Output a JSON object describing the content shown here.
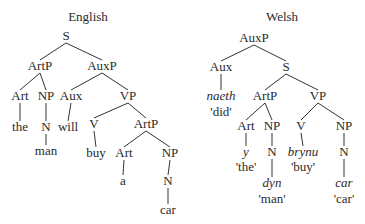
{
  "trees": [
    {
      "id": "english",
      "title": {
        "text": "English",
        "x": 88,
        "y": 21
      },
      "nodes": [
        {
          "id": "S",
          "label": "S",
          "x": 66,
          "y": 40
        },
        {
          "id": "ArtP1",
          "label": "ArtP",
          "x": 40,
          "y": 70
        },
        {
          "id": "AuxP",
          "label": "AuxP",
          "x": 102,
          "y": 70
        },
        {
          "id": "Art1",
          "label": "Art",
          "x": 20,
          "y": 100
        },
        {
          "id": "NP1",
          "label": "NP",
          "x": 46,
          "y": 100
        },
        {
          "id": "Aux",
          "label": "Aux",
          "x": 71,
          "y": 100
        },
        {
          "id": "VP",
          "label": "VP",
          "x": 128,
          "y": 100
        },
        {
          "id": "the",
          "label": "the",
          "x": 20,
          "y": 131
        },
        {
          "id": "N1",
          "label": "N",
          "x": 46,
          "y": 131
        },
        {
          "id": "will",
          "label": "will",
          "x": 68,
          "y": 131
        },
        {
          "id": "V",
          "label": "V",
          "x": 94,
          "y": 128
        },
        {
          "id": "ArtP2",
          "label": "ArtP",
          "x": 146,
          "y": 128
        },
        {
          "id": "man",
          "label": "man",
          "x": 46,
          "y": 155
        },
        {
          "id": "buy",
          "label": "buy",
          "x": 96,
          "y": 157
        },
        {
          "id": "Art2",
          "label": "Art",
          "x": 124,
          "y": 157
        },
        {
          "id": "NP2",
          "label": "NP",
          "x": 170,
          "y": 157
        },
        {
          "id": "a",
          "label": "a",
          "x": 123,
          "y": 185
        },
        {
          "id": "N2",
          "label": "N",
          "x": 168,
          "y": 185
        },
        {
          "id": "car",
          "label": "car",
          "x": 168,
          "y": 214
        }
      ],
      "edges": [
        [
          "S",
          "ArtP1"
        ],
        [
          "S",
          "AuxP"
        ],
        [
          "ArtP1",
          "Art1"
        ],
        [
          "ArtP1",
          "NP1"
        ],
        [
          "AuxP",
          "Aux"
        ],
        [
          "AuxP",
          "VP"
        ],
        [
          "Art1",
          "the"
        ],
        [
          "NP1",
          "N1"
        ],
        [
          "Aux",
          "will"
        ],
        [
          "VP",
          "V"
        ],
        [
          "VP",
          "ArtP2"
        ],
        [
          "N1",
          "man"
        ],
        [
          "V",
          "buy"
        ],
        [
          "ArtP2",
          "Art2"
        ],
        [
          "ArtP2",
          "NP2"
        ],
        [
          "Art2",
          "a"
        ],
        [
          "NP2",
          "N2"
        ],
        [
          "N2",
          "car"
        ]
      ]
    },
    {
      "id": "welsh",
      "title": {
        "text": "Welsh",
        "x": 282,
        "y": 21
      },
      "nodes": [
        {
          "id": "AuxP",
          "label": "AuxP",
          "x": 254,
          "y": 42
        },
        {
          "id": "Aux",
          "label": "Aux",
          "x": 221,
          "y": 71
        },
        {
          "id": "S",
          "label": "S",
          "x": 286,
          "y": 71
        },
        {
          "id": "naeth",
          "label": "naeth",
          "x": 221,
          "y": 100,
          "italic": true
        },
        {
          "id": "did",
          "label": "'did'",
          "x": 221,
          "y": 116
        },
        {
          "id": "ArtP",
          "label": "ArtP",
          "x": 265,
          "y": 100
        },
        {
          "id": "VP",
          "label": "VP",
          "x": 318,
          "y": 100
        },
        {
          "id": "Art",
          "label": "Art",
          "x": 246,
          "y": 130
        },
        {
          "id": "NP1",
          "label": "NP",
          "x": 272,
          "y": 130
        },
        {
          "id": "V",
          "label": "V",
          "x": 301,
          "y": 130
        },
        {
          "id": "NP2",
          "label": "NP",
          "x": 344,
          "y": 130
        },
        {
          "id": "y",
          "label": "y",
          "x": 246,
          "y": 156,
          "italic": true
        },
        {
          "id": "the",
          "label": "'the'",
          "x": 246,
          "y": 171
        },
        {
          "id": "N1",
          "label": "N",
          "x": 272,
          "y": 156
        },
        {
          "id": "brynu",
          "label": "brynu",
          "x": 303,
          "y": 156,
          "italic": true
        },
        {
          "id": "buy",
          "label": "'buy'",
          "x": 303,
          "y": 171
        },
        {
          "id": "N2",
          "label": "N",
          "x": 344,
          "y": 156
        },
        {
          "id": "dyn",
          "label": "dyn",
          "x": 272,
          "y": 187,
          "italic": true
        },
        {
          "id": "man",
          "label": "'man'",
          "x": 272,
          "y": 203
        },
        {
          "id": "car",
          "label": "car",
          "x": 344,
          "y": 187,
          "italic": true
        },
        {
          "id": "car_gloss",
          "label": "'car'",
          "x": 344,
          "y": 203
        }
      ],
      "edges": [
        [
          "AuxP",
          "Aux"
        ],
        [
          "AuxP",
          "S"
        ],
        [
          "Aux",
          "naeth"
        ],
        [
          "S",
          "ArtP"
        ],
        [
          "S",
          "VP"
        ],
        [
          "ArtP",
          "Art"
        ],
        [
          "ArtP",
          "NP1"
        ],
        [
          "VP",
          "V"
        ],
        [
          "VP",
          "NP2"
        ],
        [
          "Art",
          "y"
        ],
        [
          "NP1",
          "N1"
        ],
        [
          "V",
          "brynu"
        ],
        [
          "NP2",
          "N2"
        ],
        [
          "N1",
          "dyn"
        ],
        [
          "N2",
          "car"
        ]
      ]
    }
  ]
}
